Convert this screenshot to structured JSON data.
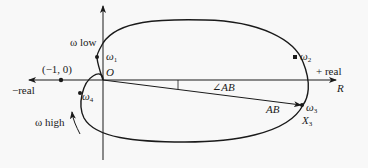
{
  "diagram": {
    "type": "nyquist-plot",
    "axes": {
      "positive_real_label": "+ real",
      "negative_real_label": "−real",
      "real_axis_name": "R",
      "origin_label": "O"
    },
    "points": {
      "minus_one": "(−1, 0)",
      "w1": {
        "symbol": "ω",
        "sub": "1"
      },
      "w2": {
        "symbol": "ω",
        "sub": "2"
      },
      "w3": {
        "symbol": "ω",
        "sub": "3"
      },
      "w4": {
        "symbol": "ω",
        "sub": "4"
      },
      "x3": {
        "symbol": "X",
        "sub": "3"
      }
    },
    "annotations": {
      "omega_low": "ω low",
      "omega_high": "ω high",
      "magnitude": "AB",
      "angle": "∠AB"
    },
    "colors": {
      "stroke": "#1a1a1a",
      "background": "#f8f8f8"
    }
  }
}
